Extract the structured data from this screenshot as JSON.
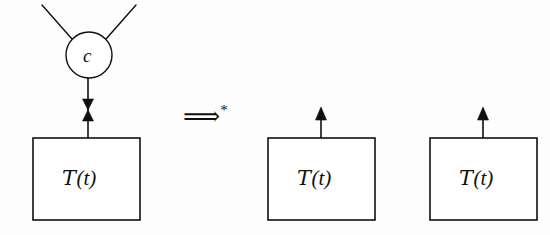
{
  "figure": {
    "kind": "term-graph-rewrite-diagram",
    "width": 550,
    "height": 235,
    "background_color": "#fdfdfd",
    "stroke_color": "#101010",
    "text_color": "#101010"
  },
  "left_side": {
    "node": {
      "label": "c",
      "shape": "circle",
      "center_x": 89,
      "center_y": 55,
      "radius": 23
    },
    "incoming_edges": [
      {
        "name": "upper-left-edge",
        "x1": 42,
        "y1": 5,
        "x2": 72,
        "y2": 39
      },
      {
        "name": "upper-right-edge",
        "x1": 136,
        "y1": 5,
        "x2": 106,
        "y2": 39
      }
    ],
    "node_to_box_edge": {
      "x": 88,
      "y_top": 78,
      "y_bottom": 138,
      "marker": "bowtie-double-arrowhead",
      "marker_center_y": 109
    },
    "box": {
      "label_script": "T",
      "label_arg": "(t)",
      "x": 33,
      "y": 138,
      "width": 107,
      "height": 82
    }
  },
  "rewrite": {
    "symbol": "⟹",
    "superscript": "*",
    "x": 183,
    "y": 103
  },
  "right_side": {
    "boxes": [
      {
        "name": "middle-box",
        "label_script": "T",
        "label_arg": "(t)",
        "x": 268,
        "y": 138,
        "width": 107,
        "height": 82,
        "out_arrow": {
          "x": 321,
          "y_top": 108,
          "y_bottom": 138
        }
      },
      {
        "name": "right-box",
        "label_script": "T",
        "label_arg": "(t)",
        "x": 430,
        "y": 138,
        "width": 107,
        "height": 82,
        "out_arrow": {
          "x": 483,
          "y_top": 108,
          "y_bottom": 138
        }
      }
    ]
  }
}
